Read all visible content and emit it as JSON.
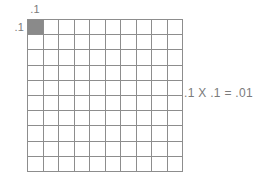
{
  "figure": {
    "background_color": "#ffffff",
    "grid_line_color": "#8d8d8d",
    "shaded_cell_color": "#8a8a8a",
    "text_color": "#7b7b7b",
    "column_label": ".1",
    "row_label": ".1",
    "equation": ".1 X .1 = .01",
    "grid": {
      "columns": 10,
      "rows": 10,
      "total_cells": 100,
      "shaded_cells": 1,
      "shaded_positions": [
        [
          0,
          0
        ]
      ]
    }
  },
  "chart_data": {
    "type": "heatmap",
    "title": "",
    "subtitle": "",
    "xlabel": ".1",
    "ylabel": ".1",
    "annotations": [
      ".1 X .1 = .01"
    ],
    "grid": true,
    "legend": "none",
    "columns": 10,
    "rows": 10,
    "values": [
      [
        1,
        0,
        0,
        0,
        0,
        0,
        0,
        0,
        0,
        0
      ],
      [
        0,
        0,
        0,
        0,
        0,
        0,
        0,
        0,
        0,
        0
      ],
      [
        0,
        0,
        0,
        0,
        0,
        0,
        0,
        0,
        0,
        0
      ],
      [
        0,
        0,
        0,
        0,
        0,
        0,
        0,
        0,
        0,
        0
      ],
      [
        0,
        0,
        0,
        0,
        0,
        0,
        0,
        0,
        0,
        0
      ],
      [
        0,
        0,
        0,
        0,
        0,
        0,
        0,
        0,
        0,
        0
      ],
      [
        0,
        0,
        0,
        0,
        0,
        0,
        0,
        0,
        0,
        0
      ],
      [
        0,
        0,
        0,
        0,
        0,
        0,
        0,
        0,
        0,
        0
      ],
      [
        0,
        0,
        0,
        0,
        0,
        0,
        0,
        0,
        0,
        0
      ],
      [
        0,
        0,
        0,
        0,
        0,
        0,
        0,
        0,
        0,
        0
      ]
    ],
    "shaded_count": 1,
    "shaded_fraction": 0.01,
    "colors": {
      "off": "#ffffff",
      "on": "#8a8a8a"
    }
  }
}
